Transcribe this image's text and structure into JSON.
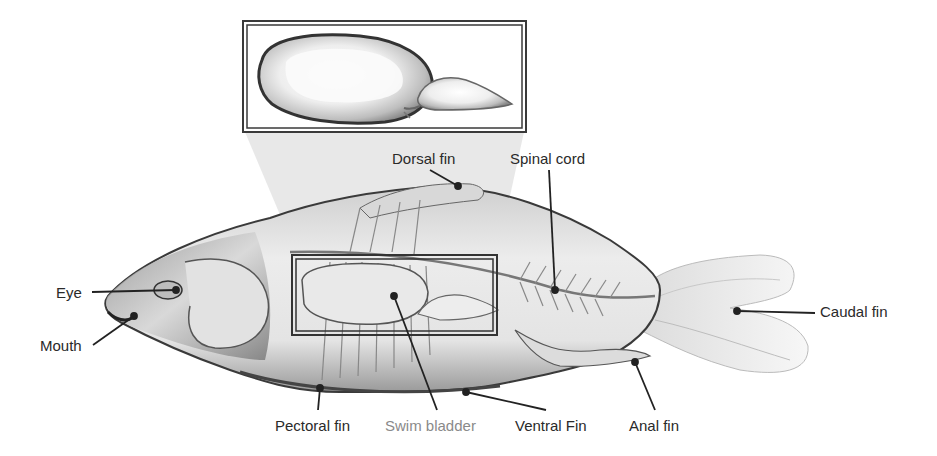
{
  "diagram": {
    "inset": {
      "name": "Swim bladder (enlarged)",
      "frame_color": "#333333"
    },
    "highlight_box": {
      "name": "Swim bladder region",
      "frame_color": "#333333"
    },
    "labels": [
      {
        "id": "dorsal-fin",
        "text": "Dorsal fin",
        "x": 392,
        "y": 150,
        "muted": false
      },
      {
        "id": "spinal-cord",
        "text": "Spinal cord",
        "x": 510,
        "y": 150,
        "muted": false
      },
      {
        "id": "eye",
        "text": "Eye",
        "x": 56,
        "y": 284,
        "muted": false
      },
      {
        "id": "mouth",
        "text": "Mouth",
        "x": 40,
        "y": 337,
        "muted": false
      },
      {
        "id": "caudal-fin",
        "text": "Caudal fin",
        "x": 820,
        "y": 303,
        "muted": false
      },
      {
        "id": "pectoral-fin",
        "text": "Pectoral fin",
        "x": 275,
        "y": 417,
        "muted": false
      },
      {
        "id": "swim-bladder",
        "text": "Swim bladder",
        "x": 385,
        "y": 417,
        "muted": true
      },
      {
        "id": "ventral-fin",
        "text": "Ventral Fin",
        "x": 515,
        "y": 417,
        "muted": false
      },
      {
        "id": "anal-fin",
        "text": "Anal fin",
        "x": 629,
        "y": 417,
        "muted": false
      }
    ],
    "colors": {
      "label_text": "#2a2a2a",
      "muted_label_text": "#8a8a8a",
      "leader_line": "#222222",
      "body_fill": "#e6e6e6",
      "body_outline": "#3a3a3a"
    }
  }
}
